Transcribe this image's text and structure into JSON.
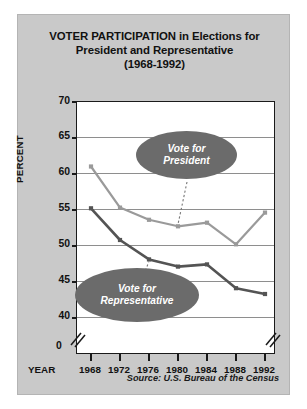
{
  "chart_data": {
    "type": "line",
    "title": "VOTER PARTICIPATION in Elections for President and Representative (1968-1992)",
    "title_lines": [
      "VOTER PARTICIPATION in Elections for",
      "President and Representative",
      "(1968-1992)"
    ],
    "xlabel": "YEAR",
    "ylabel": "PERCENT",
    "categories": [
      "1968",
      "1972",
      "1976",
      "1980",
      "1984",
      "1988",
      "1992"
    ],
    "ylim": [
      40,
      70
    ],
    "yticks": [
      "70",
      "65",
      "60",
      "55",
      "50",
      "45",
      "40"
    ],
    "ytick_values": [
      70,
      65,
      60,
      55,
      50,
      45,
      40
    ],
    "axis_origin_label": "0",
    "axis_break": true,
    "grid": true,
    "legend_position": "inline-callouts",
    "series": [
      {
        "name": "Vote for President",
        "color": "#9a9a9a",
        "values": [
          60.9,
          55.2,
          53.5,
          52.6,
          53.1,
          50.1,
          54.5
        ]
      },
      {
        "name": "Vote for Representative",
        "color": "#545454",
        "values": [
          55.1,
          50.7,
          48.0,
          47.0,
          47.3,
          44.0,
          43.2
        ]
      }
    ],
    "annotations": [
      {
        "text": "Vote for President",
        "lines": [
          "Vote for",
          "President"
        ],
        "target_year": "1980"
      },
      {
        "text": "Vote for Representative",
        "lines": [
          "Vote for",
          "Representative"
        ],
        "target_year": "1976"
      }
    ],
    "source": "Source: U.S. Bureau of the Census"
  },
  "colors": {
    "card_background": "#c9c9c9",
    "plot_background": "#ffffff",
    "frame": "#1a1a1a",
    "gridline": "#8e8e8e",
    "president_line": "#9a9a9a",
    "representative_line": "#545454",
    "callout_fill": "#6b6b6b",
    "callout_text": "#ffffff"
  }
}
